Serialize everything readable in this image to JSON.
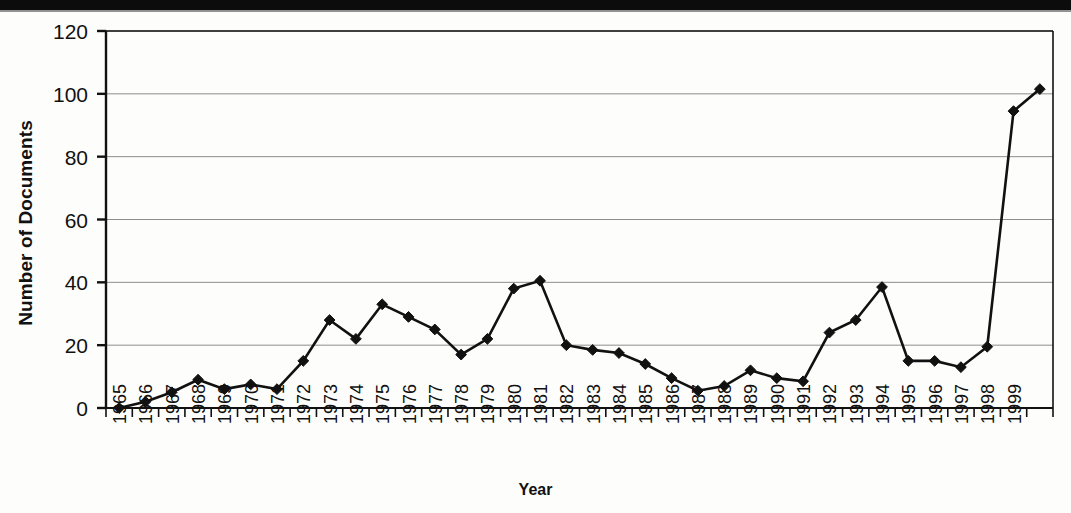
{
  "figure": {
    "background_color": "#fdfdfc",
    "ink_color": "#111111",
    "gridline_color": "#8d8d8d",
    "scan_band_color": "#0c0c0c"
  },
  "axis_titles": {
    "y": "Number of Documents",
    "x": "Year"
  },
  "chart_data": {
    "type": "line",
    "title": "",
    "subtitle": "",
    "xlabel": "Year",
    "ylabel": "Number of Documents",
    "xlim": [
      1964.5,
      2000.5
    ],
    "ylim": [
      0,
      120
    ],
    "yticks": [
      0,
      20,
      40,
      60,
      80,
      100,
      120
    ],
    "ytick_labels": [
      "0",
      "20",
      "40",
      "60",
      "80",
      "100",
      "120"
    ],
    "grid": true,
    "grid_axis": "y",
    "legend": null,
    "legend_position": "none",
    "marker": "diamond",
    "line_color": "#111111",
    "marker_color": "#111111",
    "categories": [
      "1965",
      "1966",
      "1967",
      "1968",
      "1969",
      "1970",
      "1971",
      "1972",
      "1973",
      "1974",
      "1975",
      "1976",
      "1977",
      "1978",
      "1979",
      "1980",
      "1981",
      "1982",
      "1983",
      "1984",
      "1985",
      "1986",
      "1987",
      "1988",
      "1989",
      "1990",
      "1991",
      "1992",
      "1993",
      "1994",
      "1995",
      "1996",
      "1997",
      "1998",
      "1999",
      ""
    ],
    "xtick_labels": [
      "1965",
      "1966",
      "1967",
      "1968",
      "1969",
      "1970",
      "1971",
      "1972",
      "1973",
      "1974",
      "1975",
      "1976",
      "1977",
      "1978",
      "1979",
      "1980",
      "1981",
      "1982",
      "1983",
      "1984",
      "1985",
      "1986",
      "1987",
      "1988",
      "1989",
      "1990",
      "1991",
      "1992",
      "1993",
      "1994",
      "1995",
      "1996",
      "1997",
      "1998",
      "1999"
    ],
    "x": [
      1965,
      1966,
      1967,
      1968,
      1969,
      1970,
      1971,
      1972,
      1973,
      1974,
      1975,
      1976,
      1977,
      1978,
      1979,
      1980,
      1981,
      1982,
      1983,
      1984,
      1985,
      1986,
      1987,
      1988,
      1989,
      1990,
      1991,
      1992,
      1993,
      1994,
      1995,
      1996,
      1997,
      1998,
      1999,
      2000
    ],
    "values": [
      0,
      2,
      5,
      9,
      6,
      7.5,
      6,
      15,
      28,
      22,
      33,
      29,
      25,
      17,
      22,
      38,
      40.5,
      20,
      18.5,
      17.5,
      14,
      9.5,
      5.5,
      7,
      12,
      9.5,
      8.5,
      24,
      28,
      38.5,
      15,
      15,
      13,
      19.5,
      94.5,
      101.5
    ]
  }
}
